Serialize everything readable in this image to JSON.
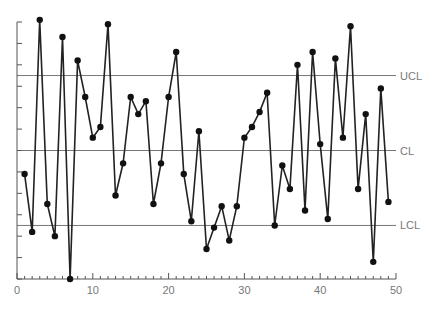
{
  "chart_data": {
    "type": "line",
    "title": "",
    "xlabel": "",
    "ylabel": "",
    "xlim": [
      0,
      50
    ],
    "ylim": [
      0,
      12
    ],
    "x_ticks_major": [
      0,
      10,
      20,
      30,
      40,
      50
    ],
    "x_tick_labels": [
      "0",
      "10",
      "20",
      "30",
      "40",
      "50"
    ],
    "y_tick_count": 12,
    "y_tick_labels": [],
    "grid": false,
    "x": [
      1,
      2,
      3,
      4,
      5,
      6,
      7,
      8,
      9,
      10,
      11,
      12,
      13,
      14,
      15,
      16,
      17,
      18,
      19,
      20,
      21,
      22,
      23,
      24,
      25,
      26,
      27,
      28,
      29,
      30,
      31,
      32,
      33,
      34,
      35,
      36,
      37,
      38,
      39,
      40,
      41,
      42,
      43,
      44,
      45,
      46,
      47,
      48,
      49
    ],
    "series": [
      {
        "name": "measurement",
        "values": [
          4.9,
          2.2,
          12.1,
          3.5,
          2.0,
          11.3,
          0.0,
          10.2,
          8.5,
          6.6,
          7.1,
          11.9,
          3.9,
          5.4,
          8.5,
          7.7,
          8.3,
          3.5,
          5.4,
          8.5,
          10.6,
          4.9,
          2.7,
          6.9,
          1.4,
          2.4,
          3.4,
          1.8,
          3.4,
          6.6,
          7.1,
          7.8,
          8.7,
          2.5,
          5.3,
          4.2,
          10.0,
          3.2,
          10.6,
          6.3,
          2.8,
          10.3,
          6.6,
          11.8,
          4.2,
          7.7,
          0.8,
          8.9,
          3.6
        ]
      }
    ],
    "control_limits": [
      {
        "name": "UCL",
        "label": "UCL",
        "value": 9.5
      },
      {
        "name": "CL",
        "label": "CL",
        "value": 6.0
      },
      {
        "name": "LCL",
        "label": "LCL",
        "value": 2.5
      }
    ]
  }
}
